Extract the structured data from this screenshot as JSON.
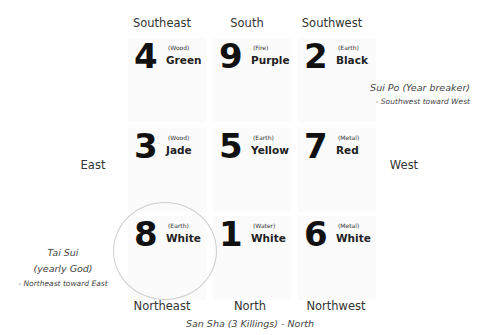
{
  "directions": {
    "southeast": "Southeast",
    "south": "South",
    "southwest": "Southwest",
    "east": "East",
    "west": "West",
    "northeast": "Northeast",
    "north": "North",
    "northwest": "Northwest"
  },
  "grid": [
    {
      "position": "southeast",
      "number": "4",
      "element": "(Wood)",
      "color": "Green"
    },
    {
      "position": "south",
      "number": "9",
      "element": "(Fire)",
      "color": "Purple"
    },
    {
      "position": "southwest",
      "number": "2",
      "element": "(Earth)",
      "color": "Black"
    },
    {
      "position": "east",
      "number": "3",
      "element": "(Wood)",
      "color": "Jade"
    },
    {
      "position": "center",
      "number": "5",
      "element": "(Earth)",
      "color": "Yellow"
    },
    {
      "position": "west",
      "number": "7",
      "element": "(Metal)",
      "color": "Red"
    },
    {
      "position": "northeast",
      "number": "8",
      "element": "(Earth)",
      "color": "White"
    },
    {
      "position": "north",
      "number": "1",
      "element": "(Water)",
      "color": "White"
    },
    {
      "position": "northwest",
      "number": "6",
      "element": "(Metal)",
      "color": "White"
    }
  ],
  "annotations": {
    "sui_po_title": "Sui Po (Year breaker)",
    "sui_po_detail": "- Southwest toward West",
    "tai_sui_title": "Tai Sui",
    "tai_sui_subtitle": "(yearly God)",
    "tai_sui_detail": "- Northeast toward East",
    "san_sha": "San Sha (3 Killings) - North"
  }
}
